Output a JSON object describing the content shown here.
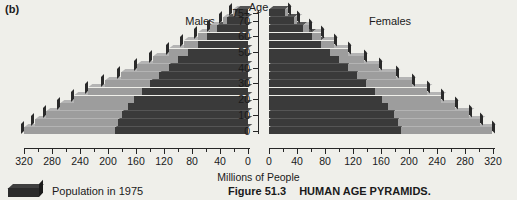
{
  "panel_letter": "(b)",
  "titles": {
    "age_axis": "Age",
    "males": "Males",
    "females": "Females",
    "x_axis": "Millions of People"
  },
  "legend": {
    "swatch_name": "population-1975-swatch",
    "label": "Population in 1975"
  },
  "caption": {
    "figure_number": "Figure 51.3",
    "figure_title": "HUMAN AGE PYRAMIDS."
  },
  "colors": {
    "dark_1975": "#3a3a3a",
    "light_projected": "#9d9d9d",
    "axis": "#262626",
    "background": "#efefea"
  },
  "chart_data": {
    "type": "bar",
    "title": "HUMAN AGE PYRAMIDS.",
    "subtitle": "Figure 51.3",
    "xlabel": "Millions of People",
    "ylabel": "Age",
    "orientation": "horizontal-diverging",
    "grid": false,
    "legend_position": "bottom-left",
    "xlim": [
      0,
      320
    ],
    "xticks_major": [
      0,
      40,
      80,
      120,
      160,
      200,
      240,
      280,
      320
    ],
    "xtick_minor_step": 20,
    "age_groups": [
      "0",
      "5",
      "10",
      "15",
      "20",
      "25",
      "30",
      "35",
      "40",
      "45",
      "50",
      "55",
      "60",
      "65",
      "70",
      "75+"
    ],
    "age_axis_labels": [
      "0",
      "10",
      "20",
      "30",
      "40",
      "50",
      "60",
      "70",
      "75+"
    ],
    "series": [
      {
        "name": "Population in 1975",
        "shade": "dark"
      },
      {
        "name": "Projected increase",
        "shade": "light"
      }
    ],
    "males": {
      "label": "Males",
      "direction": "left",
      "total": [
        320,
        305,
        288,
        268,
        248,
        228,
        205,
        182,
        158,
        136,
        113,
        92,
        72,
        54,
        36,
        22
      ],
      "population_1975": [
        190,
        186,
        180,
        172,
        163,
        152,
        140,
        127,
        113,
        100,
        86,
        72,
        58,
        44,
        30,
        18
      ]
    },
    "females": {
      "label": "Females",
      "direction": "right",
      "total": [
        318,
        302,
        286,
        266,
        246,
        226,
        204,
        181,
        157,
        135,
        113,
        93,
        74,
        57,
        40,
        27
      ],
      "population_1975": [
        188,
        184,
        178,
        170,
        161,
        151,
        139,
        126,
        113,
        100,
        87,
        74,
        61,
        48,
        35,
        23
      ]
    }
  }
}
